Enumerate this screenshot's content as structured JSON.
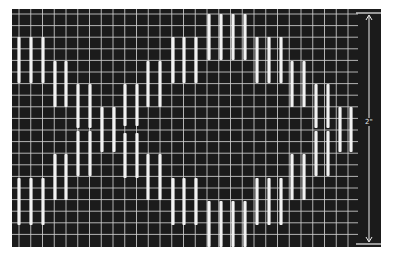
{
  "figure": {
    "colors": {
      "background": "#ffffff",
      "panel": "#1b1b1b",
      "grid": "#cfcfcf",
      "stitch": "#f2f2f2"
    },
    "grid": {
      "left": 12,
      "top": 9,
      "right": 358,
      "bottom": 247,
      "col_start": 19,
      "col_step": 11.75,
      "cols": 30,
      "row_start": 14,
      "row_step": 11.6,
      "rows": 20
    },
    "stitches": [
      {
        "x": 19,
        "y1": 37,
        "y2": 83
      },
      {
        "x": 31,
        "y1": 37,
        "y2": 83
      },
      {
        "x": 43,
        "y1": 37,
        "y2": 83
      },
      {
        "x": 55,
        "y1": 61,
        "y2": 107
      },
      {
        "x": 66,
        "y1": 61,
        "y2": 107
      },
      {
        "x": 78,
        "y1": 84,
        "y2": 128
      },
      {
        "x": 90,
        "y1": 84,
        "y2": 128
      },
      {
        "x": 102,
        "y1": 107,
        "y2": 152
      },
      {
        "x": 114,
        "y1": 107,
        "y2": 152
      },
      {
        "x": 125,
        "y1": 84,
        "y2": 126
      },
      {
        "x": 137,
        "y1": 84,
        "y2": 126
      },
      {
        "x": 148,
        "y1": 61,
        "y2": 107
      },
      {
        "x": 160,
        "y1": 61,
        "y2": 107
      },
      {
        "x": 173,
        "y1": 37,
        "y2": 83
      },
      {
        "x": 184,
        "y1": 37,
        "y2": 83
      },
      {
        "x": 196,
        "y1": 37,
        "y2": 83
      },
      {
        "x": 209,
        "y1": 14,
        "y2": 60
      },
      {
        "x": 221,
        "y1": 14,
        "y2": 60
      },
      {
        "x": 233,
        "y1": 14,
        "y2": 60
      },
      {
        "x": 245,
        "y1": 14,
        "y2": 60
      },
      {
        "x": 257,
        "y1": 37,
        "y2": 83
      },
      {
        "x": 269,
        "y1": 37,
        "y2": 83
      },
      {
        "x": 281,
        "y1": 37,
        "y2": 83
      },
      {
        "x": 292,
        "y1": 61,
        "y2": 107
      },
      {
        "x": 304,
        "y1": 61,
        "y2": 107
      },
      {
        "x": 316,
        "y1": 84,
        "y2": 128
      },
      {
        "x": 328,
        "y1": 84,
        "y2": 128
      },
      {
        "x": 340,
        "y1": 107,
        "y2": 152
      },
      {
        "x": 351,
        "y1": 107,
        "y2": 152
      },
      {
        "x": 19,
        "y1": 178,
        "y2": 225
      },
      {
        "x": 31,
        "y1": 178,
        "y2": 225
      },
      {
        "x": 43,
        "y1": 178,
        "y2": 225
      },
      {
        "x": 55,
        "y1": 154,
        "y2": 200
      },
      {
        "x": 66,
        "y1": 154,
        "y2": 200
      },
      {
        "x": 78,
        "y1": 131,
        "y2": 176
      },
      {
        "x": 90,
        "y1": 131,
        "y2": 176
      },
      {
        "x": 125,
        "y1": 133,
        "y2": 178
      },
      {
        "x": 137,
        "y1": 133,
        "y2": 178
      },
      {
        "x": 148,
        "y1": 154,
        "y2": 200
      },
      {
        "x": 160,
        "y1": 154,
        "y2": 200
      },
      {
        "x": 173,
        "y1": 178,
        "y2": 225
      },
      {
        "x": 184,
        "y1": 178,
        "y2": 225
      },
      {
        "x": 196,
        "y1": 178,
        "y2": 225
      },
      {
        "x": 209,
        "y1": 201,
        "y2": 247
      },
      {
        "x": 221,
        "y1": 201,
        "y2": 247
      },
      {
        "x": 233,
        "y1": 201,
        "y2": 247
      },
      {
        "x": 245,
        "y1": 201,
        "y2": 247
      },
      {
        "x": 257,
        "y1": 178,
        "y2": 225
      },
      {
        "x": 269,
        "y1": 178,
        "y2": 225
      },
      {
        "x": 281,
        "y1": 178,
        "y2": 225
      },
      {
        "x": 292,
        "y1": 154,
        "y2": 200
      },
      {
        "x": 304,
        "y1": 154,
        "y2": 200
      },
      {
        "x": 316,
        "y1": 131,
        "y2": 176
      },
      {
        "x": 328,
        "y1": 131,
        "y2": 176
      }
    ],
    "scale_bar": {
      "x": 369,
      "top": 13,
      "bottom": 244,
      "tick_left": 356,
      "tick_right": 381,
      "label": "2\"",
      "label_y": 118
    }
  }
}
